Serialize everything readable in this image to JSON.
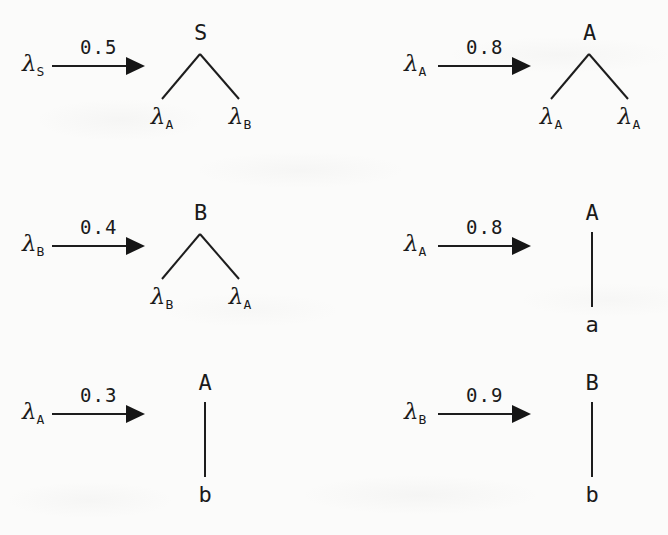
{
  "document": {
    "kind": "handwritten-typeset grammar production rules",
    "background_color": "#fbfbfa",
    "ink_color": "#1a1a1a"
  },
  "lambda_glyph": "λ",
  "rules": [
    {
      "id": "rule-1",
      "lhs": {
        "symbol": "λ",
        "subscript": "S"
      },
      "probability": "0.5",
      "tree": {
        "root": "S",
        "shape": "binary",
        "children": [
          {
            "symbol": "λ",
            "subscript": "A",
            "terminal": false
          },
          {
            "symbol": "λ",
            "subscript": "B",
            "terminal": false
          }
        ]
      }
    },
    {
      "id": "rule-2",
      "lhs": {
        "symbol": "λ",
        "subscript": "A"
      },
      "probability": "0.8",
      "tree": {
        "root": "A",
        "shape": "binary",
        "children": [
          {
            "symbol": "λ",
            "subscript": "A",
            "terminal": false
          },
          {
            "symbol": "λ",
            "subscript": "A",
            "terminal": false
          }
        ]
      }
    },
    {
      "id": "rule-3",
      "lhs": {
        "symbol": "λ",
        "subscript": "B"
      },
      "probability": "0.4",
      "tree": {
        "root": "B",
        "shape": "binary",
        "children": [
          {
            "symbol": "λ",
            "subscript": "B",
            "terminal": false
          },
          {
            "symbol": "λ",
            "subscript": "A",
            "terminal": false
          }
        ]
      }
    },
    {
      "id": "rule-4",
      "lhs": {
        "symbol": "λ",
        "subscript": "A"
      },
      "probability": "0.8",
      "tree": {
        "root": "A",
        "shape": "unary",
        "children": [
          {
            "symbol": "a",
            "subscript": "",
            "terminal": true
          }
        ]
      }
    },
    {
      "id": "rule-5",
      "lhs": {
        "symbol": "λ",
        "subscript": "A"
      },
      "probability": "0.3",
      "tree": {
        "root": "A",
        "shape": "unary",
        "children": [
          {
            "symbol": "b",
            "subscript": "",
            "terminal": true
          }
        ]
      }
    },
    {
      "id": "rule-6",
      "lhs": {
        "symbol": "λ",
        "subscript": "B"
      },
      "probability": "0.9",
      "tree": {
        "root": "B",
        "shape": "unary",
        "children": [
          {
            "symbol": "b",
            "subscript": "",
            "terminal": true
          }
        ]
      }
    }
  ]
}
